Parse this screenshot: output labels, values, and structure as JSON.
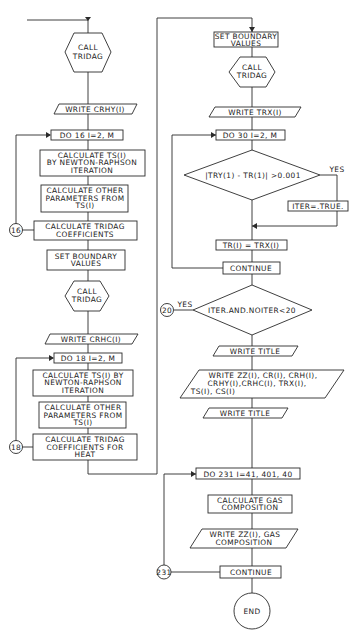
{
  "diagram": {
    "type": "flowchart",
    "left_column": {
      "call_tridag_1": {
        "line1": "CALL",
        "line2": "TRIDAG"
      },
      "write_crhy": "WRITE  CRHY(I)",
      "do16": "DO 16  I=2, M",
      "calc_ts_1": {
        "line1": "CALCULATE  TS(I)",
        "line2": "BY NEWTON-RAPHSON",
        "line3": "ITERATION"
      },
      "calc_other_1": {
        "line1": "CALCULATE OTHER",
        "line2": "PARAMETERS FROM",
        "line3": "TS(I)"
      },
      "tridag_coeff_1": {
        "line1": "CALCULATE  TRIDAG",
        "line2": "COEFFICIENTS"
      },
      "connector_16": "16",
      "set_boundary_1": {
        "line1": "SET  BOUNDARY",
        "line2": "VALUES"
      },
      "call_tridag_2": {
        "line1": "CALL",
        "line2": "TRIDAG"
      },
      "write_crhc": "WRITE  CRHC(I)",
      "do18": "DO 18  I=2, M",
      "calc_ts_2": {
        "line1": "CALCULATE  TS(I) BY",
        "line2": "NEWTON-RAPHSON",
        "line3": "ITERATION"
      },
      "calc_other_2": {
        "line1": "CALCULATE OTHER",
        "line2": "PARAMETERS FROM",
        "line3": "TS(I)"
      },
      "tridag_coeff_heat": {
        "line1": "CALCULATE  TRIDAG",
        "line2": "COEFFICIENTS  FOR",
        "line3": "HEAT"
      },
      "connector_18": "18"
    },
    "right_column": {
      "set_boundary_2": {
        "line1": "SET BOUNDARY",
        "line2": "VALUES"
      },
      "call_tridag_3": {
        "line1": "CALL",
        "line2": "TRIDAG"
      },
      "write_trx": "WRITE  TRX(I)",
      "do30": "DO 30  I=2, M",
      "decision_1": "|TRY(1) - TR(1)| >0.001",
      "decision_1_yes": "YES",
      "iter_true": "ITER=.TRUE.",
      "tr_assign": "TR(I) = TRX(I)",
      "continue_1": "CONTINUE",
      "decision_2": "ITER.AND.NOITER<20",
      "decision_2_yes": "YES",
      "connector_20": "20",
      "write_title_1": "WRITE  TITLE",
      "write_all": {
        "line1": "WRITE   ZZ(I), CR(I), CRH(I),",
        "line2": "CRHY(I),CRHC(I), TRX(I),",
        "line3": "TS(I), CS(I)"
      },
      "write_title_2": "WRITE  TITLE",
      "do231": "DO 231  I=41, 401, 40",
      "calc_gas": {
        "line1": "CALCULATE GAS",
        "line2": "COMPOSITION"
      },
      "write_gas": {
        "line1": "WRITE ZZ(I), GAS",
        "line2": "COMPOSITION"
      },
      "continue_2": "CONTINUE",
      "connector_231": "231",
      "end": "END"
    }
  }
}
